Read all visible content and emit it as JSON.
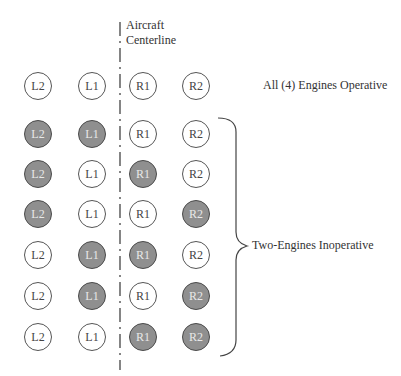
{
  "centerline": {
    "line1": "Aircraft",
    "line2": "Centerline"
  },
  "labels": {
    "all_operative": "All (4) Engines Operative",
    "two_inoperative": "Two-Engines Inoperative"
  },
  "columns": [
    "L2",
    "L1",
    "R1",
    "R2"
  ],
  "colors": {
    "inoperative_fill": "#8f8f8f",
    "operative_fill": "#ffffff",
    "stroke": "#555555"
  },
  "rows": [
    {
      "group": "all-operative",
      "states": [
        "op",
        "op",
        "op",
        "op"
      ]
    },
    {
      "group": "two-inoperative",
      "states": [
        "inop",
        "inop",
        "op",
        "op"
      ]
    },
    {
      "group": "two-inoperative",
      "states": [
        "inop",
        "op",
        "inop",
        "op"
      ]
    },
    {
      "group": "two-inoperative",
      "states": [
        "inop",
        "op",
        "op",
        "inop"
      ]
    },
    {
      "group": "two-inoperative",
      "states": [
        "op",
        "inop",
        "inop",
        "op"
      ]
    },
    {
      "group": "two-inoperative",
      "states": [
        "op",
        "inop",
        "op",
        "inop"
      ]
    },
    {
      "group": "two-inoperative",
      "states": [
        "op",
        "op",
        "inop",
        "inop"
      ]
    }
  ]
}
